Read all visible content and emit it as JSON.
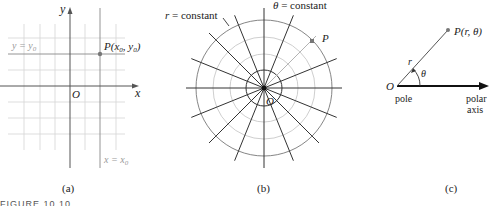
{
  "panels": {
    "a": {
      "caption": "(a)",
      "axis_x_label": "x",
      "axis_y_label": "y",
      "origin_label": "O",
      "point_label": "P(x0, y0)",
      "hline_label": "y = y0",
      "vline_label": "x = x0"
    },
    "b": {
      "caption": "(b)",
      "r_label": "r = constant",
      "theta_label": "θ = constant",
      "point_label": "P",
      "origin_label": "O"
    },
    "c": {
      "caption": "(c)",
      "origin_label": "O",
      "pole_label": "pole",
      "axis_label_1": "polar",
      "axis_label_2": "axis",
      "point_label": "P(r, θ)",
      "r_label": "r",
      "theta_label": "θ"
    }
  },
  "figure_caption": "FIGURE 10.10",
  "colors": {
    "grid_light": "#cfcfcf",
    "axis": "#555555",
    "dark": "#222222",
    "point": "#777777"
  }
}
